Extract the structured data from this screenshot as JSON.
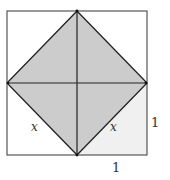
{
  "figure": {
    "type": "geometry-diagram",
    "colors": {
      "diamond_fill": "#cccccc",
      "light_triangle_fill": "#f0f0f0",
      "stroke": "#222222",
      "outer_stroke": "#555555"
    },
    "labels": {
      "left_side": "x",
      "right_side": "x",
      "right_edge": "1",
      "bottom_edge": "1"
    }
  }
}
